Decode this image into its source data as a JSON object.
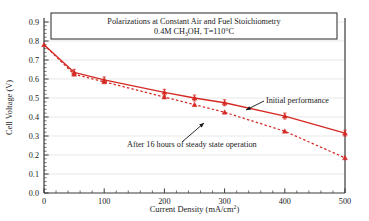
{
  "chart_data": {
    "type": "line",
    "title": "Polarizations at Constant Air and Fuel Stoichiometry",
    "subtitle_prefix": "0.4M CH",
    "subtitle_sub": "3",
    "subtitle_suffix": "OH, T=110°C",
    "subtitle_plain": "0.4M CH3OH, T=110°C",
    "xlabel_prefix": "Current Density (mA/cm",
    "xlabel_sup": "2",
    "xlabel_suffix": ")",
    "xlabel_plain": "Current Density (mA/cm2)",
    "ylabel": "Cell Voltage (V)",
    "xlim": [
      0,
      500
    ],
    "ylim": [
      0.0,
      0.9
    ],
    "xticks": [
      0,
      100,
      200,
      300,
      400,
      500
    ],
    "xtick_labels": [
      "0",
      "100",
      "200",
      "300",
      "400",
      "500"
    ],
    "xminor_interval": 20,
    "yticks": [
      0.0,
      0.1,
      0.2,
      0.3,
      0.4,
      0.5,
      0.6,
      0.7,
      0.8,
      0.9
    ],
    "ytick_labels": [
      "0.0",
      "0.1",
      "0.2",
      "0.3",
      "0.4",
      "0.5",
      "0.6",
      "0.7",
      "0.8",
      "0.9"
    ],
    "yminor_interval": 0.02,
    "grid": "horizontal-major-light",
    "legend": "annotations",
    "series_color": "#d42a24",
    "series": [
      {
        "name": "Initial performance",
        "style": "solid",
        "marker": "triangle-up-with-errorbar",
        "x": [
          0,
          50,
          100,
          200,
          250,
          300,
          400,
          500
        ],
        "values": [
          0.78,
          0.635,
          0.595,
          0.53,
          0.5,
          0.475,
          0.405,
          0.315
        ]
      },
      {
        "name": "After 16 hours of steady state operation",
        "style": "dashed",
        "marker": "triangle-up",
        "x": [
          0,
          50,
          100,
          200,
          250,
          300,
          400,
          500
        ],
        "values": [
          0.78,
          0.625,
          0.585,
          0.505,
          0.465,
          0.425,
          0.325,
          0.185
        ]
      }
    ],
    "annotations": [
      {
        "name": "initial-performance",
        "text": "Initial performance",
        "text_x": 266,
        "text_y": 103,
        "arrow_from_x": 264,
        "arrow_from_y": 101,
        "arrow_to_x": 246,
        "arrow_to_y": 110
      },
      {
        "name": "after-16-hours",
        "text": "After 16 hours of steady state operation",
        "text_x": 127,
        "text_y": 147,
        "arrow_from_x": 182,
        "arrow_from_y": 142,
        "arrow_to_x": 204,
        "arrow_to_y": 123
      }
    ]
  }
}
